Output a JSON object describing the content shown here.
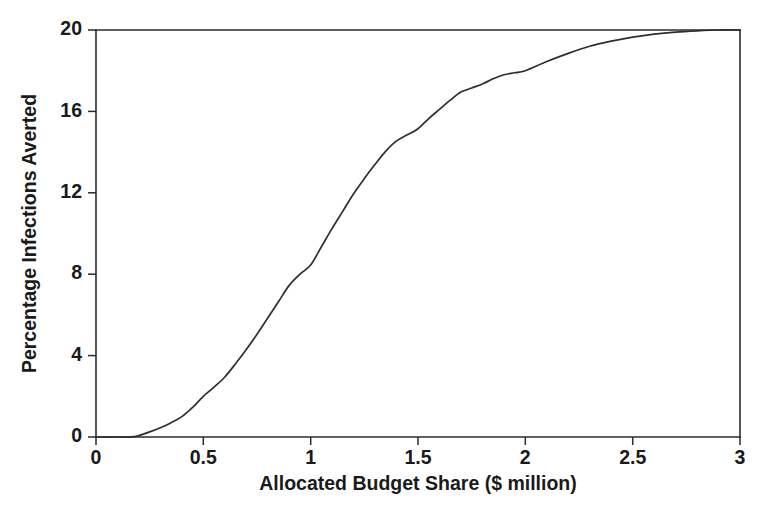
{
  "chart_data": {
    "type": "line",
    "title": "",
    "xlabel": "Allocated Budget Share ($ million)",
    "ylabel": "Percentage Infections Averted",
    "xlim": [
      0,
      3
    ],
    "ylim": [
      0,
      20
    ],
    "xticks": [
      0,
      0.5,
      1,
      1.5,
      2,
      2.5,
      3
    ],
    "xticklabels": [
      "0",
      "0.5",
      "1",
      "1.5",
      "2",
      "2.5",
      "3"
    ],
    "yticks": [
      0,
      4,
      8,
      12,
      16,
      20
    ],
    "yticklabels": [
      "0",
      "4",
      "8",
      "12",
      "16",
      "20"
    ],
    "grid": false,
    "legend": null,
    "line_color": "#2e2e2e",
    "background_color": "#ffffff",
    "series": [
      {
        "name": "Percentage Infections Averted",
        "x": [
          0.0,
          0.1,
          0.18,
          0.25,
          0.3,
          0.35,
          0.4,
          0.45,
          0.5,
          0.55,
          0.6,
          0.65,
          0.7,
          0.75,
          0.8,
          0.85,
          0.9,
          0.95,
          1.0,
          1.05,
          1.1,
          1.15,
          1.2,
          1.25,
          1.3,
          1.35,
          1.4,
          1.45,
          1.5,
          1.55,
          1.6,
          1.65,
          1.7,
          1.75,
          1.8,
          1.85,
          1.9,
          1.95,
          2.0,
          2.1,
          2.2,
          2.3,
          2.4,
          2.5,
          2.6,
          2.7,
          2.8,
          2.9,
          3.0
        ],
        "y": [
          0.0,
          0.0,
          0.02,
          0.25,
          0.45,
          0.7,
          1.0,
          1.45,
          2.0,
          2.45,
          2.95,
          3.6,
          4.3,
          5.05,
          5.85,
          6.65,
          7.45,
          8.0,
          8.45,
          9.35,
          10.25,
          11.1,
          11.95,
          12.7,
          13.4,
          14.05,
          14.55,
          14.85,
          15.15,
          15.65,
          16.1,
          16.55,
          16.95,
          17.15,
          17.35,
          17.6,
          17.8,
          17.9,
          18.0,
          18.45,
          18.85,
          19.2,
          19.45,
          19.65,
          19.8,
          19.9,
          19.96,
          20.0,
          20.0
        ]
      }
    ],
    "annotations": []
  },
  "axes": {
    "x_title": "Allocated Budget Share ($ million)",
    "y_title": "Percentage Infections Averted"
  }
}
